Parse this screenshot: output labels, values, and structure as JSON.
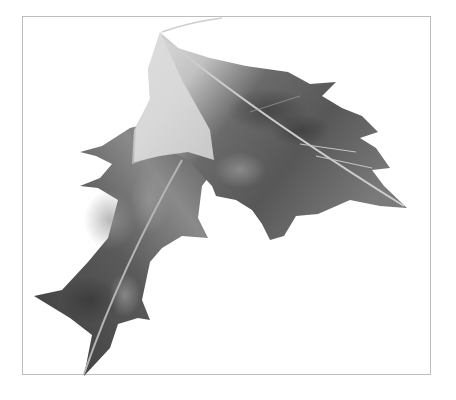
{
  "image": {
    "subject": "holly leaves pencil drawing",
    "style": "graphite illustration",
    "frame": {
      "border_color": "#bdbdbd",
      "background": "#ffffff"
    },
    "palette": {
      "dark": "#3a3a3a",
      "mid": "#6e6e6e",
      "light": "#b9b9b9",
      "highlight": "#e6e6e6",
      "vein": "#c9c9c9"
    },
    "elements": [
      {
        "name": "upper-leaf",
        "tone": "mid-to-dark gray with pale left half"
      },
      {
        "name": "lower-leaf",
        "tone": "dark gray with mottled highlights"
      },
      {
        "name": "stem",
        "tone": "light gray thin stroke"
      }
    ]
  }
}
